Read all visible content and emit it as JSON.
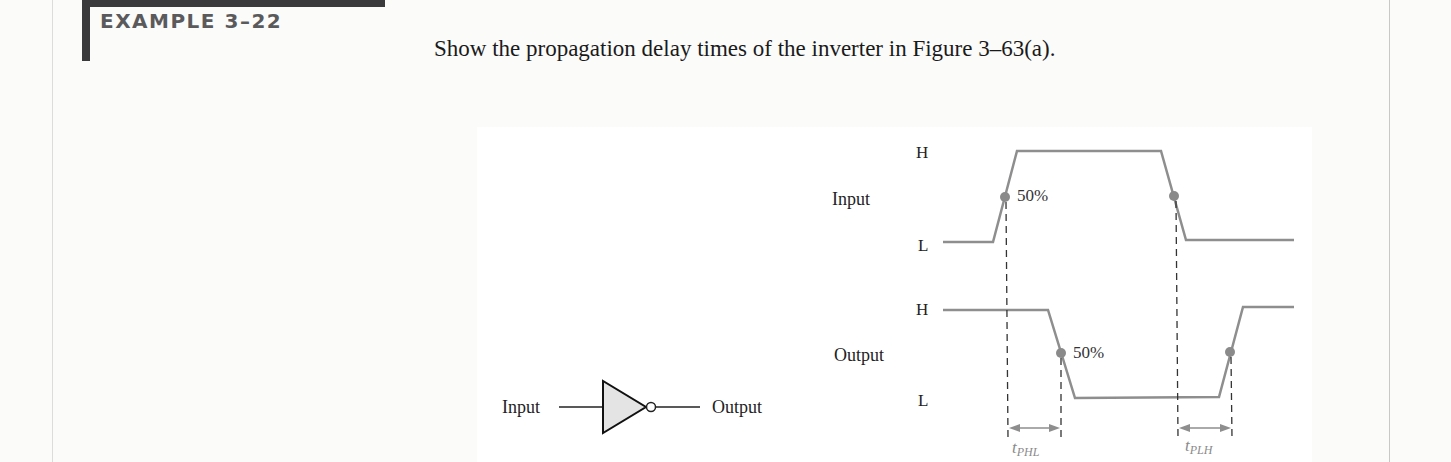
{
  "example": {
    "title": "EXAMPLE 3–22",
    "prompt": "Show the propagation delay times of the inverter in Figure 3–63(a)."
  },
  "inverter": {
    "input_label": "Input",
    "output_label": "Output",
    "icon": "not-gate-icon"
  },
  "timing_diagram": {
    "input": {
      "label": "Input",
      "high_label": "H",
      "low_label": "L",
      "rising_percent": "50%"
    },
    "output": {
      "label": "Output",
      "high_label": "H",
      "low_label": "L",
      "falling_percent": "50%"
    },
    "delays": {
      "phl": {
        "t": "t",
        "sub": "PHL"
      },
      "plh": {
        "t": "t",
        "sub": "PLH"
      }
    },
    "colors": {
      "waveform": "#8e8e8e",
      "dot": "#8a8a8a",
      "dash": "#333333",
      "arrow": "#8e8e8e"
    }
  }
}
